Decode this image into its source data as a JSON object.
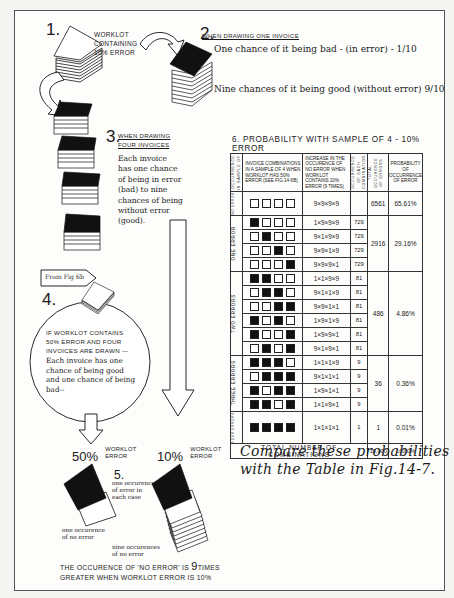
{
  "step1": {
    "num": "1.",
    "label_lines": [
      "WORKLOT",
      "CONTAINING",
      "10% ERROR"
    ]
  },
  "step2": {
    "num": "2.",
    "heading": "WHEN DRAWING ONE INVOICE",
    "line1": "One chance of it being bad - (in error) - 1/10",
    "line2": "Nine chances of it being good (without error) 9/10"
  },
  "step3": {
    "num": "3.",
    "heading_lines": [
      "WHEN DRAWING",
      "FOUR INVOICES"
    ],
    "body_lines": [
      "Each invoice",
      "has one chance",
      "of being in error",
      "(bad) to nine",
      "chances of being",
      "without error",
      "(good)."
    ]
  },
  "step4": {
    "from_label": "From Fig 6b",
    "num": "4.",
    "caps_lines": [
      "IF WORKLOT CONTAINS",
      "50% ERROR AND FOUR",
      "INVOICES ARE DRAWN —"
    ],
    "body_lines": [
      "Each invoice has one",
      "chance of being good",
      "and one chance of being",
      "bad--"
    ]
  },
  "arrows": {
    "left": {
      "pct": "50%",
      "label_lines": [
        "WORKLOT",
        "ERROR"
      ]
    },
    "right": {
      "pct": "10%",
      "label_lines": [
        "WORKLOT",
        "ERROR"
      ]
    }
  },
  "step5": {
    "num": "5.",
    "note_lines": [
      "one occurence",
      "of error in",
      "each case"
    ],
    "left_caption_lines": [
      "one occurence",
      "of no error"
    ],
    "right_caption_lines": [
      "nine occurences",
      "of no error"
    ]
  },
  "conclusion": {
    "line1_a": "THE OCCURENCE OF 'NO ERROR' IS ",
    "line1_b": "9",
    "line1_c": "TIMES",
    "line2": "GREATER WHEN WORKLOT ERROR IS 10%"
  },
  "table": {
    "title": "6. PROBABILITY WITH SAMPLE OF 4 - 10% ERROR",
    "headers": [
      "Occurrence in sample of",
      "Invoice combinations in a sample of 4 when worklot has 50% error (see Fig.14-6b)",
      "Increase in the occurence of no error when worklot contains 10% error (9 times)",
      "Occurrence of each combination",
      "Total occurence of errors",
      "Probability of occurrence of error"
    ],
    "groups": [
      {
        "label": "No error",
        "rows": [
          {
            "boxes": [
              0,
              0,
              0,
              0
            ],
            "formula": "9×9×9×9",
            "each": ""
          }
        ],
        "total": "6561",
        "prob": "65.61%"
      },
      {
        "label": "One error",
        "rows": [
          {
            "boxes": [
              1,
              0,
              0,
              0
            ],
            "formula": "1×9×9×9",
            "each": "729"
          },
          {
            "boxes": [
              0,
              1,
              0,
              0
            ],
            "formula": "9×1×9×9",
            "each": "729"
          },
          {
            "boxes": [
              0,
              0,
              1,
              0
            ],
            "formula": "9×9×1×9",
            "each": "729"
          },
          {
            "boxes": [
              0,
              0,
              0,
              1
            ],
            "formula": "9×9×9×1",
            "each": "729"
          }
        ],
        "total": "2916",
        "prob": "29.16%"
      },
      {
        "label": "Two errors",
        "rows": [
          {
            "boxes": [
              1,
              1,
              0,
              0
            ],
            "formula": "1×1×9×9",
            "each": "81"
          },
          {
            "boxes": [
              0,
              1,
              1,
              0
            ],
            "formula": "9×1×1×9",
            "each": "81"
          },
          {
            "boxes": [
              0,
              0,
              1,
              1
            ],
            "formula": "9×9×1×1",
            "each": "81"
          },
          {
            "boxes": [
              1,
              0,
              1,
              0
            ],
            "formula": "1×9×1×9",
            "each": "81"
          },
          {
            "boxes": [
              1,
              0,
              0,
              1
            ],
            "formula": "1×9×9×1",
            "each": "81"
          },
          {
            "boxes": [
              0,
              1,
              0,
              1
            ],
            "formula": "9×1×9×1",
            "each": "81"
          }
        ],
        "total": "486",
        "prob": "4.86%"
      },
      {
        "label": "Three errors",
        "rows": [
          {
            "boxes": [
              1,
              1,
              1,
              0
            ],
            "formula": "1×1×1×9",
            "each": "9"
          },
          {
            "boxes": [
              0,
              1,
              1,
              1
            ],
            "formula": "9×1×1×1",
            "each": "9"
          },
          {
            "boxes": [
              1,
              0,
              1,
              1
            ],
            "formula": "1×9×1×1",
            "each": "9"
          },
          {
            "boxes": [
              1,
              1,
              0,
              1
            ],
            "formula": "1×1×9×1",
            "each": "9"
          }
        ],
        "total": "36",
        "prob": "0.36%"
      },
      {
        "label": "Four errors",
        "rows": [
          {
            "boxes": [
              1,
              1,
              1,
              1
            ],
            "formula": "1×1×1×1",
            "each": "1"
          }
        ],
        "total": "1",
        "prob": "0.01%"
      }
    ],
    "footer": {
      "label": "TOTAL NUMBER OF COMBINATIONS",
      "total": "10,000",
      "prob": "100.0%"
    }
  },
  "compare_note": {
    "line1": "Compare these probabilities",
    "line2": "with the Table in Fig.14-7."
  },
  "colors": {
    "ink": "#1a1a1a",
    "paper": "#fdfdfc",
    "filled_box": "#111111"
  }
}
